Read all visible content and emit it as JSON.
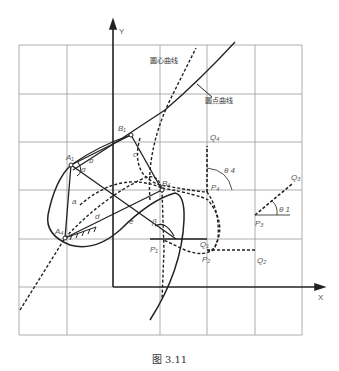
{
  "figure": {
    "caption": "图 3.11",
    "axes": {
      "x_label": "X",
      "y_label": "Y"
    },
    "curve_labels": {
      "center_curve": "圆心曲线",
      "arc_curve": "圆点曲线"
    },
    "points": {
      "A1": "A₁",
      "A4": "A₄",
      "B1": "B₁",
      "B4": "B₄",
      "P1": "P₁",
      "P2": "P₂",
      "P3": "P₃",
      "P4": "P₄",
      "Q1": "Q₁",
      "Q2": "Q₂",
      "Q3": "Q₃",
      "Q4": "Q₄"
    },
    "links": {
      "a": "a",
      "b": "b",
      "c": "c",
      "d": "d",
      "e": "e"
    },
    "angles": {
      "alpha": "α",
      "beta": "β",
      "theta1": "θ 1",
      "theta4": "θ 4"
    }
  }
}
